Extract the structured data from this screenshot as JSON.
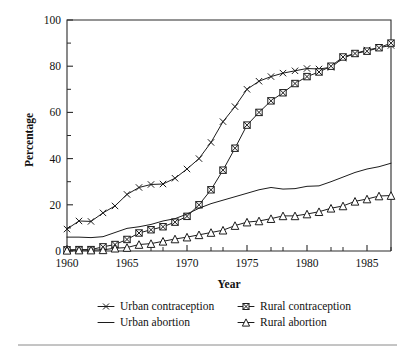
{
  "chart_data": {
    "type": "line",
    "title": "",
    "xlabel": "Year",
    "ylabel": "Percentage",
    "xlim": [
      1960,
      1987
    ],
    "ylim": [
      0,
      100
    ],
    "grid": false,
    "legend_position": "bottom",
    "x_major_ticks": [
      1960,
      1965,
      1970,
      1975,
      1980,
      1985
    ],
    "x_minor_ticks": [
      1961,
      1962,
      1963,
      1964,
      1966,
      1967,
      1968,
      1969,
      1971,
      1972,
      1973,
      1974,
      1976,
      1977,
      1978,
      1979,
      1981,
      1982,
      1983,
      1984,
      1986,
      1987
    ],
    "y_major_ticks": [
      0,
      20,
      40,
      60,
      80,
      100
    ],
    "y_minor_ticks": [
      10,
      30,
      50,
      70,
      90
    ],
    "x_tick_labels": [
      "1960",
      "1965",
      "1970",
      "1975",
      "1980",
      "1985"
    ],
    "y_tick_labels": [
      "0",
      "20",
      "40",
      "60",
      "80",
      "100"
    ],
    "x": [
      1960,
      1961,
      1962,
      1963,
      1964,
      1965,
      1966,
      1967,
      1968,
      1969,
      1970,
      1971,
      1972,
      1973,
      1974,
      1975,
      1976,
      1977,
      1978,
      1979,
      1980,
      1981,
      1982,
      1983,
      1984,
      1985,
      1986,
      1987
    ],
    "series": [
      {
        "name": "Urban contraception",
        "marker": "x",
        "values": [
          9.5,
          13.0,
          12.8,
          16.5,
          19.5,
          24.5,
          27.5,
          28.8,
          29.0,
          31.5,
          35.5,
          40.0,
          47.0,
          56.0,
          62.5,
          70.0,
          73.5,
          75.5,
          77.0,
          78.0,
          79.0,
          78.8,
          79.5,
          83.5,
          85.5,
          87.0,
          88.0,
          89.0
        ]
      },
      {
        "name": "Rural contraception",
        "marker": "square",
        "values": [
          0.5,
          0.6,
          0.6,
          1.8,
          2.8,
          5.0,
          7.8,
          9.2,
          10.5,
          12.5,
          15.0,
          20.0,
          26.5,
          35.0,
          44.5,
          54.5,
          60.0,
          65.0,
          68.5,
          72.5,
          75.5,
          77.5,
          80.0,
          84.0,
          85.5,
          86.5,
          88.0,
          90.0
        ]
      },
      {
        "name": "Urban abortion",
        "marker": "none",
        "values": [
          6.0,
          6.0,
          5.8,
          6.2,
          8.0,
          9.8,
          10.5,
          11.5,
          13.0,
          14.0,
          16.0,
          18.5,
          20.5,
          22.0,
          23.5,
          25.0,
          26.5,
          27.5,
          26.8,
          27.0,
          28.0,
          28.2,
          30.0,
          32.0,
          34.0,
          35.5,
          36.5,
          38.0
        ]
      },
      {
        "name": "Rural abortion",
        "marker": "triangle",
        "values": [
          0.3,
          0.4,
          0.4,
          0.5,
          1.2,
          1.5,
          2.8,
          3.2,
          4.2,
          5.2,
          6.0,
          7.0,
          8.0,
          9.0,
          11.0,
          12.5,
          13.0,
          14.0,
          15.2,
          15.2,
          16.0,
          17.0,
          18.5,
          19.5,
          21.5,
          22.5,
          23.8,
          24.0
        ]
      }
    ],
    "legend_entries": [
      {
        "label": "Urban contraception",
        "marker": "x"
      },
      {
        "label": "Rural contraception",
        "marker": "square"
      },
      {
        "label": "Urban abortion",
        "marker": "none"
      },
      {
        "label": "Rural abortion",
        "marker": "triangle"
      }
    ],
    "colors": {
      "line": "#1c1c1c",
      "axis": "#2a2a2a",
      "text": "#111111",
      "background": "#ffffff",
      "footer_rule": "#8a8a8a"
    }
  }
}
